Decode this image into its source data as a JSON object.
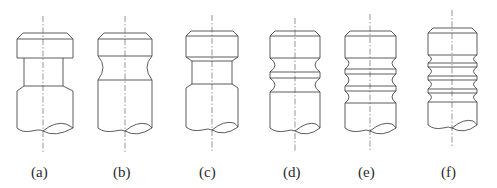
{
  "figure": {
    "line_color": "#4a4a4a",
    "centerline_color": "#6a6a6a",
    "panels": [
      {
        "id": "a",
        "label": "(a)",
        "variant": "straight neck, chamfered shoulders",
        "grooves": 1,
        "groove_shape": "rectangular"
      },
      {
        "id": "b",
        "label": "(b)",
        "variant": "single concave (round) neck",
        "grooves": 1,
        "groove_shape": "round"
      },
      {
        "id": "c",
        "label": "(c)",
        "variant": "straight neck, chamfered shoulders",
        "grooves": 1,
        "groove_shape": "rectangular"
      },
      {
        "id": "d",
        "label": "(d)",
        "variant": "two round grooves separated by one ring",
        "grooves": 2,
        "groove_shape": "round"
      },
      {
        "id": "e",
        "label": "(e)",
        "variant": "three round grooves separated by two rings",
        "grooves": 3,
        "groove_shape": "round"
      },
      {
        "id": "f",
        "label": "(f)",
        "variant": "four round grooves separated by three rings",
        "grooves": 4,
        "groove_shape": "round"
      }
    ]
  }
}
